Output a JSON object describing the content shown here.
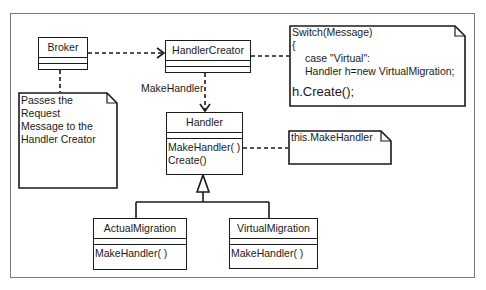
{
  "diagram": {
    "type": "UML class diagram",
    "classes": {
      "broker": {
        "name": "Broker",
        "operations": []
      },
      "handler_creator": {
        "name": "HandlerCreator",
        "operations": []
      },
      "handler": {
        "name": "Handler",
        "operations": [
          "MakeHandler( )",
          "Create()"
        ]
      },
      "actual_migration": {
        "name": "ActualMigration",
        "operations": [
          "MakeHandler( )"
        ]
      },
      "virtual_migration": {
        "name": "VirtualMigration",
        "operations": [
          "MakeHandler( )"
        ]
      }
    },
    "notes": {
      "broker_note": [
        "Passes the",
        "Request",
        "Message to the",
        "Handler Creator"
      ],
      "switch_note": [
        "Switch(Message)",
        "{",
        "case \"Virtual\":",
        "Handler h=new VirtualMigration;",
        "h.Create();"
      ],
      "this_note": [
        "this.MakeHandler"
      ]
    },
    "relations": {
      "creator_to_handler_label": "MakeHandler"
    },
    "colors": {
      "line": "#1a1a1a",
      "frame": "#7a7a7a",
      "background": "#ffffff"
    }
  }
}
